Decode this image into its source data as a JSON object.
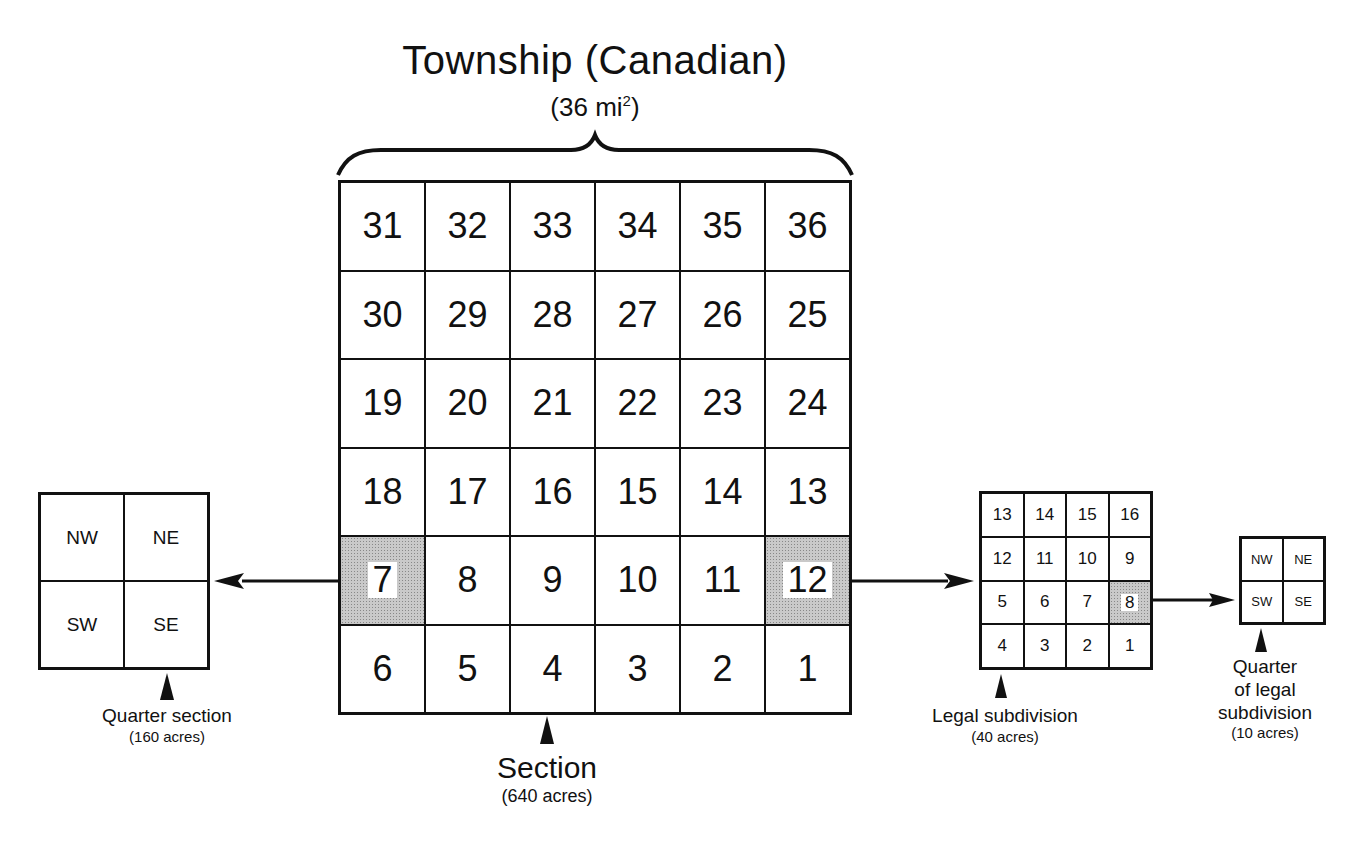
{
  "title": "Township (Canadian)",
  "subtitle_prefix": "(36 mi",
  "subtitle_sup": "2",
  "subtitle_suffix": ")",
  "township": {
    "rows": [
      [
        "31",
        "32",
        "33",
        "34",
        "35",
        "36"
      ],
      [
        "30",
        "29",
        "28",
        "27",
        "26",
        "25"
      ],
      [
        "19",
        "20",
        "21",
        "22",
        "23",
        "24"
      ],
      [
        "18",
        "17",
        "16",
        "15",
        "14",
        "13"
      ],
      [
        "7",
        "8",
        "9",
        "10",
        "11",
        "12"
      ],
      [
        "6",
        "5",
        "4",
        "3",
        "2",
        "1"
      ]
    ],
    "shaded": [
      "7",
      "12"
    ]
  },
  "section_label": {
    "main": "Section",
    "sub": "(640 acres)"
  },
  "quarter_section": {
    "cells": [
      "NW",
      "NE",
      "SW",
      "SE"
    ],
    "label": {
      "main": "Quarter section",
      "sub": "(160 acres)"
    }
  },
  "legal_subdivision": {
    "rows": [
      [
        "13",
        "14",
        "15",
        "16"
      ],
      [
        "12",
        "11",
        "10",
        "9"
      ],
      [
        "5",
        "6",
        "7",
        "8"
      ],
      [
        "4",
        "3",
        "2",
        "1"
      ]
    ],
    "shaded": [
      "8"
    ],
    "label": {
      "main": "Legal subdivision",
      "sub": "(40 acres)"
    }
  },
  "quarter_lsd": {
    "cells": [
      "NW",
      "NE",
      "SW",
      "SE"
    ],
    "label": {
      "line1": "Quarter",
      "line2": "of legal",
      "line3": "subdivision",
      "sub": "(10 acres)"
    }
  },
  "colors": {
    "line": "#111111",
    "shade": "#c9c9c9",
    "background": "#ffffff"
  }
}
